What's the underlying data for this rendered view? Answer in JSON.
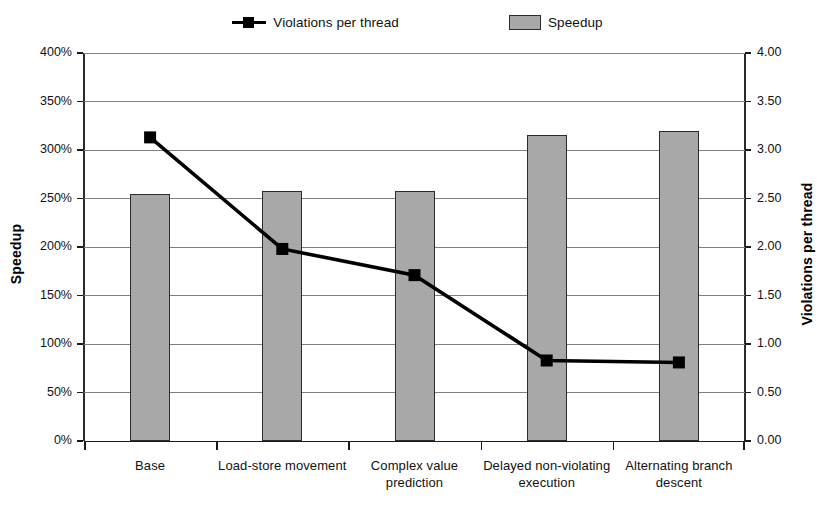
{
  "chart_data": {
    "type": "bar",
    "title": "",
    "categories": [
      "Base",
      "Load-store movement",
      "Complex value prediction",
      "Delayed non-violating execution",
      "Alternating branch descent"
    ],
    "xlabel": "",
    "ylabel": "Speedup",
    "y2label": "Violations per thread",
    "ylim": [
      0,
      400
    ],
    "y2lim": [
      0,
      4.0
    ],
    "y_ticks": [
      "0%",
      "50%",
      "100%",
      "150%",
      "200%",
      "250%",
      "300%",
      "350%",
      "400%"
    ],
    "y_tick_values": [
      0,
      50,
      100,
      150,
      200,
      250,
      300,
      350,
      400
    ],
    "y2_ticks": [
      "0.00",
      "0.50",
      "1.00",
      "1.50",
      "2.00",
      "2.50",
      "3.00",
      "3.50",
      "4.00"
    ],
    "y2_tick_values": [
      0,
      0.5,
      1.0,
      1.5,
      2.0,
      2.5,
      3.0,
      3.5,
      4.0
    ],
    "grid": true,
    "legend_position": "top-center",
    "series": [
      {
        "name": "Speedup",
        "type": "bar",
        "axis": "left",
        "unit": "%",
        "color": "#a8a8a8",
        "edge_color": "#2b2b2b",
        "values": [
          255,
          258,
          258,
          315,
          320
        ]
      },
      {
        "name": "Violations per thread",
        "type": "line",
        "axis": "right",
        "color": "#000000",
        "marker": "square",
        "values": [
          3.13,
          1.98,
          1.71,
          0.83,
          0.81
        ]
      }
    ]
  },
  "legend": {
    "entries": [
      {
        "label": "Violations per thread",
        "marker": "line-square-marker"
      },
      {
        "label": "Speedup",
        "marker": "filled-rect"
      }
    ]
  },
  "axes": {
    "left_title": "Speedup",
    "right_title": "Violations per thread"
  },
  "colors": {
    "bar_fill": "#a8a8a8",
    "bar_edge": "#2b2b2b",
    "line": "#000000",
    "gridline": "#808080",
    "background": "#ffffff"
  }
}
